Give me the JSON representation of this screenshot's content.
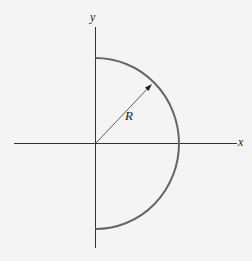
{
  "diagram": {
    "title": "",
    "labels": {
      "x_axis": "x",
      "y_axis": "y",
      "radius": "R"
    },
    "shape": "semicircle (right half)",
    "colors": {
      "background": "#f4f4f4",
      "axes": "#333333",
      "arc": "#666666",
      "radius_line": "#333333"
    }
  }
}
